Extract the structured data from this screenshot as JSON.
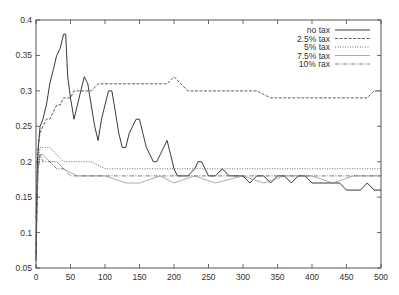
{
  "chart_data": {
    "type": "line",
    "title": "",
    "xlabel": "",
    "ylabel": "",
    "xlim": [
      0,
      500
    ],
    "ylim": [
      0.05,
      0.4
    ],
    "grid": false,
    "legend_position": "top-right",
    "x_ticks": [
      0,
      50,
      100,
      150,
      200,
      250,
      300,
      350,
      400,
      450,
      500
    ],
    "x_tick_labels": [
      "0",
      "50",
      "100",
      "150",
      "200",
      "250",
      "300",
      "350",
      "400",
      "450",
      "500"
    ],
    "y_ticks": [
      0.05,
      0.1,
      0.15,
      0.2,
      0.25,
      0.3,
      0.35,
      0.4
    ],
    "y_tick_labels": [
      "0.05",
      "0.1",
      "0.15",
      "0.2",
      "0.25",
      "0.3",
      "0.35",
      "0.4"
    ],
    "series": [
      {
        "name": "no tax",
        "style": "solid",
        "x": [
          0,
          2,
          4,
          6,
          10,
          15,
          20,
          25,
          30,
          35,
          40,
          43,
          46,
          50,
          55,
          60,
          65,
          70,
          75,
          80,
          85,
          90,
          95,
          100,
          105,
          110,
          115,
          120,
          125,
          130,
          135,
          140,
          145,
          150,
          155,
          160,
          165,
          170,
          175,
          180,
          185,
          190,
          195,
          200,
          205,
          210,
          220,
          230,
          235,
          240,
          245,
          250,
          260,
          270,
          280,
          290,
          300,
          310,
          320,
          330,
          340,
          350,
          360,
          370,
          380,
          390,
          400,
          410,
          420,
          430,
          440,
          450,
          460,
          470,
          480,
          490,
          500
        ],
        "values": [
          0.06,
          0.2,
          0.23,
          0.25,
          0.26,
          0.28,
          0.31,
          0.33,
          0.35,
          0.36,
          0.38,
          0.38,
          0.32,
          0.29,
          0.26,
          0.28,
          0.3,
          0.32,
          0.31,
          0.28,
          0.25,
          0.23,
          0.26,
          0.28,
          0.3,
          0.3,
          0.27,
          0.24,
          0.22,
          0.22,
          0.24,
          0.25,
          0.26,
          0.26,
          0.24,
          0.22,
          0.21,
          0.2,
          0.2,
          0.21,
          0.22,
          0.23,
          0.21,
          0.19,
          0.18,
          0.18,
          0.18,
          0.19,
          0.2,
          0.2,
          0.19,
          0.18,
          0.18,
          0.19,
          0.18,
          0.18,
          0.18,
          0.17,
          0.18,
          0.18,
          0.17,
          0.18,
          0.18,
          0.17,
          0.18,
          0.18,
          0.17,
          0.17,
          0.17,
          0.17,
          0.17,
          0.16,
          0.16,
          0.16,
          0.17,
          0.16,
          0.16
        ]
      },
      {
        "name": "2.5% tax",
        "style": "dashed",
        "x": [
          0,
          3,
          6,
          10,
          15,
          20,
          25,
          30,
          35,
          40,
          45,
          50,
          55,
          60,
          65,
          70,
          80,
          90,
          100,
          110,
          120,
          130,
          140,
          150,
          160,
          170,
          180,
          190,
          200,
          210,
          220,
          230,
          240,
          250,
          260,
          270,
          280,
          290,
          300,
          320,
          340,
          360,
          380,
          400,
          420,
          440,
          460,
          480,
          490,
          500
        ],
        "values": [
          0.12,
          0.22,
          0.24,
          0.25,
          0.26,
          0.26,
          0.27,
          0.28,
          0.28,
          0.29,
          0.29,
          0.29,
          0.3,
          0.3,
          0.3,
          0.3,
          0.3,
          0.31,
          0.31,
          0.31,
          0.31,
          0.31,
          0.31,
          0.31,
          0.31,
          0.31,
          0.31,
          0.31,
          0.32,
          0.31,
          0.3,
          0.3,
          0.3,
          0.3,
          0.3,
          0.3,
          0.3,
          0.3,
          0.3,
          0.3,
          0.29,
          0.29,
          0.29,
          0.29,
          0.29,
          0.29,
          0.29,
          0.29,
          0.3,
          0.3
        ]
      },
      {
        "name": "5% tax",
        "style": "dotted",
        "x": [
          0,
          3,
          6,
          10,
          20,
          30,
          40,
          50,
          60,
          80,
          100,
          120,
          150,
          200,
          250,
          300,
          350,
          400,
          450,
          500
        ],
        "values": [
          0.1,
          0.2,
          0.22,
          0.22,
          0.22,
          0.21,
          0.2,
          0.2,
          0.2,
          0.2,
          0.19,
          0.19,
          0.19,
          0.19,
          0.19,
          0.19,
          0.19,
          0.19,
          0.19,
          0.19
        ]
      },
      {
        "name": "7.5% tax",
        "style": "solid-light",
        "x": [
          0,
          3,
          6,
          10,
          20,
          30,
          40,
          60,
          80,
          100,
          130,
          150,
          180,
          200,
          230,
          260,
          300,
          330,
          360,
          400,
          430,
          460,
          500
        ],
        "values": [
          0.08,
          0.19,
          0.21,
          0.21,
          0.2,
          0.2,
          0.19,
          0.18,
          0.18,
          0.18,
          0.17,
          0.17,
          0.18,
          0.17,
          0.18,
          0.17,
          0.18,
          0.17,
          0.18,
          0.18,
          0.17,
          0.18,
          0.18
        ]
      },
      {
        "name": "10% rax",
        "style": "dash-dot",
        "x": [
          0,
          3,
          6,
          10,
          20,
          30,
          40,
          50,
          60,
          80,
          100,
          150,
          200,
          250,
          300,
          350,
          400,
          450,
          500
        ],
        "values": [
          0.07,
          0.19,
          0.21,
          0.2,
          0.2,
          0.19,
          0.19,
          0.18,
          0.18,
          0.18,
          0.18,
          0.18,
          0.18,
          0.18,
          0.18,
          0.18,
          0.18,
          0.18,
          0.18
        ]
      }
    ]
  },
  "legend": {
    "items": [
      {
        "label": "no tax",
        "dash": "",
        "color": "#222222",
        "width": 0.9
      },
      {
        "label": "2.5% tax",
        "dash": "3,1.5",
        "color": "#333333",
        "width": 0.8
      },
      {
        "label": "5% tax",
        "dash": "1,1.5",
        "color": "#444444",
        "width": 0.8
      },
      {
        "label": "7.5% tax",
        "dash": "",
        "color": "#888888",
        "width": 0.7
      },
      {
        "label": "10% rax",
        "dash": "4,1.5,1,1.5",
        "color": "#555555",
        "width": 0.8
      }
    ]
  },
  "plot": {
    "left": 36,
    "top": 20,
    "right": 381,
    "bottom": 268,
    "axis_color": "#444444"
  }
}
